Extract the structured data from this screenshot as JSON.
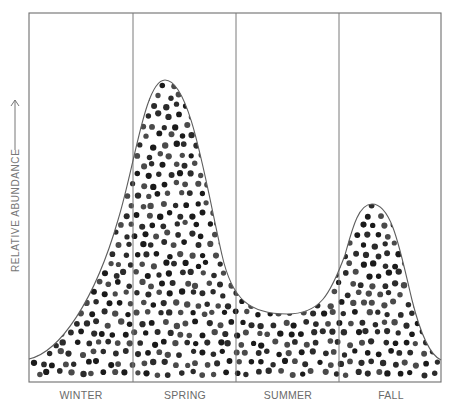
{
  "chart_data": {
    "type": "area",
    "title": "",
    "xlabel": "",
    "ylabel": "RELATIVE ABUNDANCE",
    "ylabel_arrow": "up-arrow",
    "categories": [
      "WINTER",
      "SPRING",
      "SUMMER",
      "FALL"
    ],
    "grid": false,
    "fill_pattern": "dots",
    "series": [
      {
        "name": "relative abundance",
        "description": "Seasonal abundance curve: low in winter rising to a large spring peak, dropping to a summer trough, a smaller fall peak, and low again at end of fall",
        "x": [
          0.0,
          0.25,
          0.5,
          0.75,
          1.0,
          1.3,
          1.5,
          1.75,
          2.0,
          2.5,
          3.0,
          3.3,
          3.5,
          3.75,
          4.0
        ],
        "values": [
          0.08,
          0.18,
          0.4,
          0.65,
          0.77,
          1.0,
          0.9,
          0.5,
          0.29,
          0.23,
          0.35,
          0.59,
          0.57,
          0.33,
          0.08
        ]
      }
    ],
    "peaks": [
      {
        "season": "SPRING",
        "relative_height": 1.0
      },
      {
        "season": "FALL",
        "relative_height": 0.59
      }
    ],
    "trough": {
      "season": "SUMMER",
      "relative_height": 0.23
    },
    "ylim": [
      0,
      1.2
    ]
  },
  "labels": {
    "x": [
      "WINTER",
      "SPRING",
      "SUMMER",
      "FALL"
    ],
    "y": "RELATIVE ABUNDANCE"
  }
}
